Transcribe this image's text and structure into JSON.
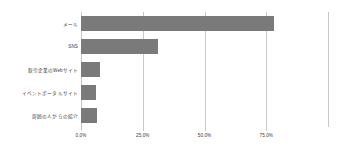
{
  "chart_data": {
    "type": "bar",
    "orientation": "horizontal",
    "title": "",
    "subtitle": "",
    "xlabel": "",
    "ylabel": "",
    "categories": [
      "メール",
      "SNS",
      "取引企業のWebサイト",
      "イベントポータルサイト",
      "周囲の人からの紹介"
    ],
    "values": [
      78.0,
      31.0,
      7.5,
      6.0,
      6.5
    ],
    "value_unit": "%",
    "xlim": [
      0,
      100
    ],
    "tick_values": [
      0,
      25,
      50,
      75
    ],
    "tick_labels": [
      "0.0%",
      "25.0%",
      "50.0%",
      "75.0%"
    ],
    "gridline_values": [
      0,
      25,
      50,
      75,
      100
    ],
    "grid": true,
    "legend": false,
    "legend_position": "none",
    "colors": {
      "bar_fill": "#7a7a7a",
      "gridline": "#c8c8c8",
      "text": "#3a3a3a",
      "background": "#ffffff"
    }
  }
}
